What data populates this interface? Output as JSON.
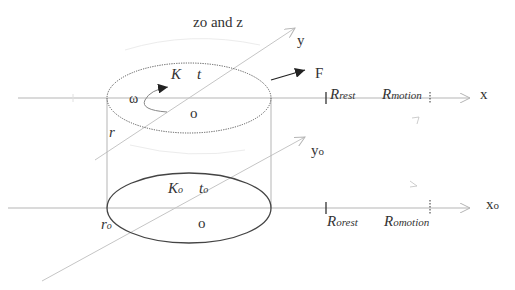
{
  "diagram": {
    "title_axis": "zo and z",
    "upper": {
      "x_label": "x",
      "y_label": "y",
      "force_label": "F",
      "omega_label": "ω",
      "K_label": "K",
      "t_label": "t",
      "origin_label": "o",
      "radius_label": "r",
      "R_rest": {
        "main": "R",
        "sub": "rest"
      },
      "R_motion": {
        "main": "R",
        "sub": "motion"
      }
    },
    "lower": {
      "x_label": "xo",
      "y_label": "yo",
      "K_label": {
        "main": "K",
        "sub": "o"
      },
      "t_label": {
        "main": "t",
        "sub": "o"
      },
      "origin_label": "o",
      "radius_label": {
        "main": "r",
        "sub": "o"
      },
      "R_rest": {
        "main": "R",
        "sub": "orest"
      },
      "R_motion": {
        "main": "R",
        "sub": "omotion"
      }
    },
    "colors": {
      "axis": "#b5b5b5",
      "ellipse": "#444444",
      "text": "#333333"
    }
  }
}
